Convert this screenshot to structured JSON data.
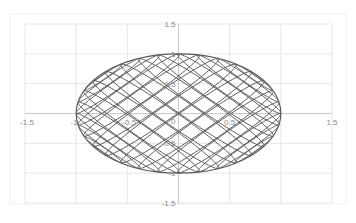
{
  "chart_data": {
    "type": "line",
    "title": "",
    "xlabel": "",
    "ylabel": "",
    "xlim": [
      -1.5,
      1.5
    ],
    "ylim": [
      -1.5,
      1.5
    ],
    "grid": true,
    "grid_step": 0.5,
    "legend": "none",
    "x_tick_labels": [
      {
        "value": -1.5,
        "label": "-1.5"
      },
      {
        "value": -1,
        "label": "-1"
      },
      {
        "value": -0.5,
        "label": "-0.5"
      },
      {
        "value": 0,
        "label": "0"
      },
      {
        "value": 0.5,
        "label": "0.5"
      },
      {
        "value": 1,
        "label": "1"
      },
      {
        "value": 1.5,
        "label": "1.5"
      }
    ],
    "y_tick_labels": [
      {
        "value": 1.5,
        "label": "1.5"
      },
      {
        "value": 1,
        "label": "1"
      },
      {
        "value": 0.5,
        "label": "0.5"
      },
      {
        "value": 0,
        "label": "0"
      },
      {
        "value": -0.5,
        "label": "-0.5"
      },
      {
        "value": -1,
        "label": "-1"
      },
      {
        "value": -1.5,
        "label": "-1.5"
      }
    ],
    "series": [
      {
        "name": "wireframe-mesh",
        "description": "Parametric crosshatched mesh filling ellipse x in [-1,1], y in [-1,1]",
        "outline": {
          "cx": 0,
          "cy": 0,
          "rx": 1,
          "ry": 1
        },
        "families": 2,
        "curves_per_family": 16,
        "tilt_deg": 50,
        "color": "#5a5a5a"
      }
    ]
  },
  "colors": {
    "background": "#ffffff",
    "grid": "#e6e6e6",
    "frame": "#f0f0f0",
    "axis": "#c8c8c8",
    "mesh": "#5a5a5a",
    "tick_text": "#8a8a8a"
  }
}
